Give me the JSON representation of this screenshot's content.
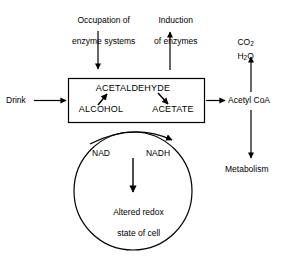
{
  "diagram": {
    "colors": {
      "stroke": "#000000",
      "background": "#ffffff",
      "text": "#000000"
    },
    "inputs": {
      "drink_label": "Drink",
      "occupation_label_line1": "Occupation of",
      "occupation_label_line2": "enzyme systems",
      "induction_label_line1": "Induction",
      "induction_label_line2": "of enzymes"
    },
    "box": {
      "alcohol_label": "ALCOHOL",
      "acetaldehyde_label": "ACETALDEHYDE",
      "acetate_label": "ACETATE"
    },
    "outputs": {
      "acetyl_coa_label": "Acetyl CoA",
      "metabolism_label": "Metabolism",
      "co2_label": "CO",
      "co2_sub": "2",
      "h2o_label_h": "H",
      "h2o_sub": "2",
      "h2o_label_o": "O"
    },
    "circle": {
      "nad_label": "NAD",
      "nadh_label": "NADH",
      "redox_line1": "Altered redox",
      "redox_line2": "state of cell"
    }
  }
}
